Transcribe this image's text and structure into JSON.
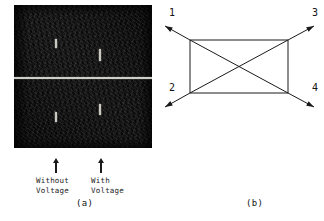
{
  "figure": {
    "panel_a": {
      "caption": "(a)",
      "image_kind": "dark-micrograph",
      "divider_kind": "horizontal-bright-line",
      "streaks": [
        {
          "name": "streak-upper-left",
          "x": 41,
          "y": 34,
          "w": 2,
          "h": 9
        },
        {
          "name": "streak-upper-right",
          "x": 85,
          "y": 44,
          "w": 2,
          "h": 12
        },
        {
          "name": "streak-lower-left",
          "x": 41,
          "y": 107,
          "w": 2,
          "h": 10
        },
        {
          "name": "streak-lower-right",
          "x": 85,
          "y": 99,
          "w": 2,
          "h": 11
        }
      ],
      "pointers": [
        {
          "name": "arrow-without-voltage",
          "x": 51,
          "y": 158,
          "label": "Without\nVoltage",
          "label_x": 36,
          "label_y": 176
        },
        {
          "name": "arrow-with-voltage",
          "x": 96,
          "y": 158,
          "label": "With\nVoltage",
          "label_x": 91,
          "label_y": 176
        }
      ],
      "caption_x": 76,
      "caption_y": 198
    },
    "panel_b": {
      "caption": "(b)",
      "caption_x": 84,
      "caption_y": 198,
      "rectangle": {
        "left": 28,
        "top": 40,
        "right": 126,
        "bottom": 93
      },
      "ports": [
        {
          "id": "1",
          "name": "port-1",
          "label_x": 7,
          "label_y": 7,
          "corner": "top-left",
          "tip_x": 3,
          "tip_y": 26
        },
        {
          "id": "3",
          "name": "port-3",
          "label_x": 150,
          "label_y": 7,
          "corner": "top-right",
          "tip_x": 152,
          "tip_y": 26
        },
        {
          "id": "2",
          "name": "port-2",
          "label_x": 7,
          "label_y": 82,
          "corner": "bottom-left",
          "tip_x": 3,
          "tip_y": 107
        },
        {
          "id": "4",
          "name": "port-4",
          "label_x": 150,
          "label_y": 82,
          "corner": "bottom-right",
          "tip_x": 152,
          "tip_y": 107
        }
      ],
      "diagonals": [
        {
          "name": "diagonal-top-left-to-bottom-right",
          "from": "top-left",
          "to": "bottom-right"
        },
        {
          "name": "diagonal-bottom-left-to-top-right",
          "from": "bottom-left",
          "to": "top-right"
        }
      ],
      "line_color": "#1a1a1a"
    }
  },
  "colors": {
    "page_background": "#ffffff",
    "ink": "#1a1a1a",
    "micrograph_background": "#0d0c0c",
    "highlight": "#cfcfc8"
  }
}
